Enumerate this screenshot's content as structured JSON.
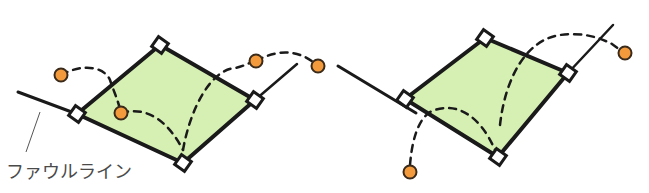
{
  "figure": {
    "label": "ファウルライン",
    "colors": {
      "field": "#d6f0b4",
      "line": "#1a1a1a",
      "ball_fill": "#f39a3c",
      "ball_stroke": "#3a2a1a",
      "base": "#ffffff",
      "text": "#4a4a4a"
    }
  },
  "diagrams": [
    {
      "name": "left-diagram",
      "home": [
        183,
        163
      ],
      "first": [
        255,
        100
      ],
      "second": [
        160,
        45
      ],
      "third": [
        77,
        114
      ],
      "foul_left": [
        [
          18,
          92
        ],
        [
          77,
          114
        ]
      ],
      "foul_right": [
        [
          255,
          100
        ],
        [
          297,
          64
        ]
      ],
      "balls": [
        [
          61,
          75
        ],
        [
          121,
          113
        ],
        [
          256,
          61
        ],
        [
          318,
          66
        ]
      ],
      "paths": [
        "M61,75 C85,62 105,68 110,80 C114,92 118,100 121,113",
        "M121,113 C150,105 170,125 183,150",
        "M183,150 C190,110 210,70 235,68 C245,66 250,62 256,61",
        "M256,61 C280,48 300,50 318,66"
      ]
    },
    {
      "name": "right-diagram",
      "home": [
        498,
        157
      ],
      "first": [
        568,
        73
      ],
      "second": [
        485,
        38
      ],
      "third": [
        405,
        99
      ],
      "foul_left": [
        [
          338,
          66
        ],
        [
          416,
          113
        ]
      ],
      "foul_right": [
        [
          568,
          73
        ],
        [
          613,
          25
        ]
      ],
      "balls": [
        [
          410,
          172
        ],
        [
          625,
          53
        ]
      ],
      "paths": [
        "M410,165 C412,140 418,120 430,112 C455,100 480,115 495,150",
        "M500,125 C505,80 525,40 560,35 C585,32 600,38 612,44 L620,50"
      ]
    }
  ]
}
